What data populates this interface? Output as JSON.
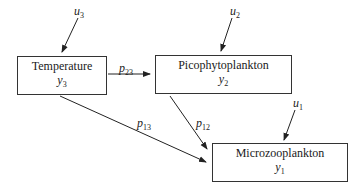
{
  "nodes": [
    {
      "id": "y3",
      "label": "Temperature",
      "var": "y",
      "sub": "3",
      "input": {
        "var": "u",
        "sub": "3"
      }
    },
    {
      "id": "y2",
      "label": "Picophytoplankton",
      "var": "y",
      "sub": "2",
      "input": {
        "var": "u",
        "sub": "2"
      }
    },
    {
      "id": "y1",
      "label": "Microzooplankton",
      "var": "y",
      "sub": "1",
      "input": {
        "var": "u",
        "sub": "1"
      }
    }
  ],
  "edges": [
    {
      "from": "y3",
      "to": "y2",
      "var": "p",
      "sub": "23"
    },
    {
      "from": "y2",
      "to": "y1",
      "var": "p",
      "sub": "12"
    },
    {
      "from": "y3",
      "to": "y1",
      "var": "p",
      "sub": "13"
    }
  ]
}
